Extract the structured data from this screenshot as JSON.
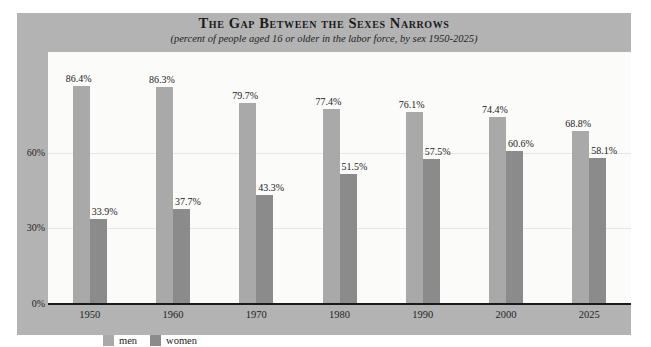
{
  "chart_data": {
    "type": "bar",
    "title": "The Gap Between the Sexes Narrows",
    "subtitle": "(percent of people aged 16 or older in the labor force, by sex 1950-2025)",
    "xlabel": "",
    "ylabel": "",
    "ylim": [
      0,
      100
    ],
    "yticks": [
      "0%",
      "30%",
      "60%"
    ],
    "ytick_values": [
      0,
      30,
      60
    ],
    "grid": true,
    "legend_position": "bottom-left",
    "categories": [
      "1950",
      "1960",
      "1970",
      "1980",
      "1990",
      "2000",
      "2025"
    ],
    "series": [
      {
        "name": "men",
        "color": "#a9a9a9",
        "values": [
          86.4,
          86.3,
          79.7,
          77.4,
          76.1,
          74.4,
          68.8
        ],
        "labels": [
          "86.4%",
          "86.3%",
          "79.7%",
          "77.4%",
          "76.1%",
          "74.4%",
          "68.8%"
        ]
      },
      {
        "name": "women",
        "color": "#8b8b8b",
        "values": [
          33.9,
          37.7,
          43.3,
          51.5,
          57.5,
          60.6,
          58.1
        ],
        "labels": [
          "33.9%",
          "37.7%",
          "43.3%",
          "51.5%",
          "57.5%",
          "60.6%",
          "58.1%"
        ]
      }
    ]
  },
  "colors": {
    "card_background": "#b3b3b3",
    "plot_background": "#fbfbfa",
    "axis": "#1a1a1a",
    "gridline": "#e8e6e2",
    "men": "#a9a9a9",
    "women": "#8b8b8b",
    "text": "#1b1b1b"
  },
  "legend": {
    "items": [
      {
        "label": "men"
      },
      {
        "label": "women"
      }
    ]
  }
}
